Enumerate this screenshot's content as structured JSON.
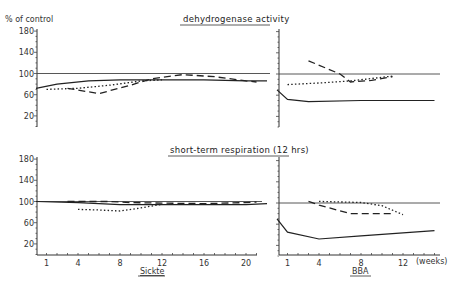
{
  "ylabel": "% of control",
  "titles": {
    "top": "dehydrogenase activity",
    "bottom": "short-term respiration (12 hrs)"
  },
  "xlabels": {
    "left": "Sickte",
    "right": "BBA",
    "unit": "(weeks)"
  },
  "yticks": [
    180,
    140,
    100,
    60,
    20
  ],
  "xticks_left": [
    1,
    4,
    8,
    12,
    16,
    20
  ],
  "xticks_right": [
    1,
    4,
    8,
    12
  ],
  "chart_data": [
    {
      "type": "line",
      "title": "dehydrogenase activity",
      "panel": "Sickte",
      "xlabel": "Sickte (weeks)",
      "ylabel": "% of control",
      "ylim": [
        0,
        180
      ],
      "xlim": [
        0,
        22
      ],
      "reference_line": 100,
      "series": [
        {
          "name": "solid",
          "style": "solid",
          "x": [
            0,
            2,
            5,
            8,
            12,
            16,
            20,
            22
          ],
          "y": [
            72,
            80,
            86,
            88,
            88,
            88,
            86,
            86
          ]
        },
        {
          "name": "dashed",
          "style": "dashed",
          "x": [
            3,
            6,
            9,
            11,
            14,
            17,
            20,
            21
          ],
          "y": [
            72,
            62,
            78,
            90,
            98,
            94,
            86,
            84
          ]
        },
        {
          "name": "dotted",
          "style": "dotted",
          "x": [
            1,
            4,
            7,
            10,
            12
          ],
          "y": [
            70,
            72,
            78,
            86,
            88
          ]
        }
      ]
    },
    {
      "type": "line",
      "title": "dehydrogenase activity",
      "panel": "BBA",
      "xlabel": "BBA (weeks)",
      "ylabel": "% of control",
      "ylim": [
        0,
        180
      ],
      "xlim": [
        0,
        15
      ],
      "reference_line": 100,
      "series": [
        {
          "name": "solid",
          "style": "solid",
          "x": [
            0,
            1,
            3,
            8,
            15
          ],
          "y": [
            70,
            52,
            48,
            50,
            50
          ]
        },
        {
          "name": "dashed",
          "style": "dashed",
          "x": [
            3,
            6,
            7,
            9,
            11
          ],
          "y": [
            125,
            100,
            85,
            88,
            95
          ]
        },
        {
          "name": "dotted",
          "style": "dotted",
          "x": [
            1,
            4,
            7,
            11
          ],
          "y": [
            80,
            83,
            87,
            96
          ]
        }
      ]
    },
    {
      "type": "line",
      "title": "short-term respiration (12 hrs)",
      "panel": "Sickte",
      "xlabel": "Sickte (weeks)",
      "ylabel": "% of control",
      "ylim": [
        0,
        180
      ],
      "xlim": [
        0,
        22
      ],
      "reference_line": 100,
      "series": [
        {
          "name": "solid",
          "style": "solid",
          "x": [
            0,
            4,
            8,
            12,
            16,
            20,
            22
          ],
          "y": [
            100,
            98,
            94,
            94,
            94,
            94,
            96
          ]
        },
        {
          "name": "dashed",
          "style": "dashed",
          "x": [
            3,
            5,
            7,
            9,
            12,
            16,
            20,
            21
          ],
          "y": [
            100,
            100,
            100,
            98,
            97,
            96,
            98,
            99
          ]
        },
        {
          "name": "dotted",
          "style": "dotted",
          "x": [
            4,
            6,
            8,
            10,
            12
          ],
          "y": [
            85,
            84,
            82,
            88,
            95
          ]
        }
      ]
    },
    {
      "type": "line",
      "title": "short-term respiration (12 hrs)",
      "panel": "BBA",
      "xlabel": "BBA (weeks)",
      "ylabel": "% of control",
      "ylim": [
        0,
        180
      ],
      "xlim": [
        0,
        15
      ],
      "reference_line": 100,
      "series": [
        {
          "name": "solid",
          "style": "solid",
          "x": [
            0,
            1,
            4,
            8,
            15
          ],
          "y": [
            70,
            45,
            32,
            38,
            48
          ]
        },
        {
          "name": "dashed",
          "style": "dashed",
          "x": [
            3,
            4,
            7,
            11
          ],
          "y": [
            103,
            96,
            80,
            80
          ]
        },
        {
          "name": "dotted",
          "style": "dotted",
          "x": [
            4,
            8,
            10,
            12
          ],
          "y": [
            103,
            101,
            95,
            78
          ]
        }
      ]
    }
  ]
}
